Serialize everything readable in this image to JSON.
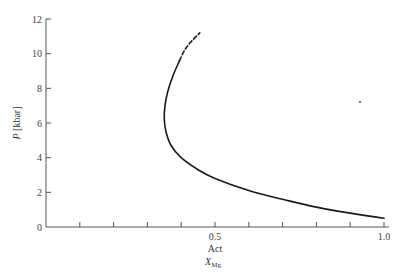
{
  "chart_data": {
    "type": "line",
    "title": "",
    "xlabel": "Act X_Mg",
    "xlabel_lines": [
      "Act",
      "X",
      "Mg"
    ],
    "ylabel": "P [kbar]",
    "ylabel_parts": {
      "var": "P",
      "unit": " [kbar]"
    },
    "xlim": [
      0,
      1.0
    ],
    "ylim": [
      0,
      12
    ],
    "x_tick_labels": [
      {
        "value": 0.5,
        "label": "0.5"
      },
      {
        "value": 1.0,
        "label": "1.0"
      }
    ],
    "x_minor_ticks": [
      0.1,
      0.2,
      0.3,
      0.4,
      0.5,
      0.6,
      0.7,
      0.8,
      0.9,
      1.0
    ],
    "y_ticks": [
      0,
      2,
      4,
      6,
      8,
      10,
      12
    ],
    "y_tick_labels": [
      "0",
      "2",
      "4",
      "6",
      "8",
      "10",
      "12"
    ],
    "grid": false,
    "legend": null,
    "series": [
      {
        "name": "Act X_Mg vs P (solid)",
        "style": "solid",
        "x": [
          1.0,
          0.9,
          0.8,
          0.7,
          0.6,
          0.5,
          0.45,
          0.4,
          0.37,
          0.355,
          0.35,
          0.352,
          0.36,
          0.375,
          0.395
        ],
        "y": [
          0.5,
          0.8,
          1.15,
          1.6,
          2.1,
          2.8,
          3.3,
          4.0,
          4.7,
          5.5,
          6.2,
          7.0,
          7.8,
          8.7,
          9.6
        ]
      },
      {
        "name": "Act X_Mg vs P (dashed extrapolation)",
        "style": "dashed",
        "x": [
          0.395,
          0.41,
          0.43,
          0.455
        ],
        "y": [
          9.6,
          10.2,
          10.7,
          11.2
        ]
      }
    ]
  }
}
